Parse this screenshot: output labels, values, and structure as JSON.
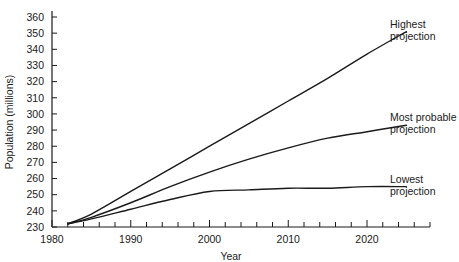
{
  "chart_data": {
    "type": "line",
    "title": "",
    "xlabel": "Year",
    "ylabel": "Population (millions)",
    "xlim": [
      1980,
      2028
    ],
    "ylim": [
      230,
      360
    ],
    "xticks": [
      1980,
      1990,
      2000,
      2010,
      2020
    ],
    "xtick_labels": [
      "1980",
      "1990",
      "2000",
      "2010",
      "2020"
    ],
    "x_minor_tick_step": 2,
    "yticks": [
      230,
      240,
      250,
      260,
      270,
      280,
      290,
      300,
      310,
      320,
      330,
      340,
      350,
      360
    ],
    "ytick_labels": [
      "230",
      "240",
      "250",
      "260",
      "270",
      "280",
      "290",
      "300",
      "310",
      "320",
      "330",
      "340",
      "350",
      "360"
    ],
    "grid": false,
    "legend_position": "right-inline-labels",
    "line_color": "#1a1a1a",
    "series": [
      {
        "name": "Highest projection",
        "label_line1": "Highest",
        "label_line2": "projection",
        "x": [
          1982,
          1985,
          1990,
          1995,
          2000,
          2005,
          2010,
          2015,
          2020,
          2025
        ],
        "values": [
          232,
          238,
          252,
          266,
          280,
          294,
          308,
          322,
          337,
          351
        ]
      },
      {
        "name": "Most probable projection",
        "label_line1": "Most probable",
        "label_line2": "projection",
        "x": [
          1982,
          1985,
          1990,
          1995,
          2000,
          2005,
          2010,
          2015,
          2020,
          2025
        ],
        "values": [
          232,
          236,
          245,
          255,
          264,
          272,
          279,
          285,
          289,
          293
        ]
      },
      {
        "name": "Lowest projection",
        "label_line1": "Lowest",
        "label_line2": "projection",
        "x": [
          1982,
          1985,
          1990,
          1995,
          2000,
          2005,
          2010,
          2015,
          2020,
          2025
        ],
        "values": [
          232,
          235,
          241,
          247,
          252,
          253,
          254,
          254,
          255,
          255
        ]
      }
    ]
  }
}
